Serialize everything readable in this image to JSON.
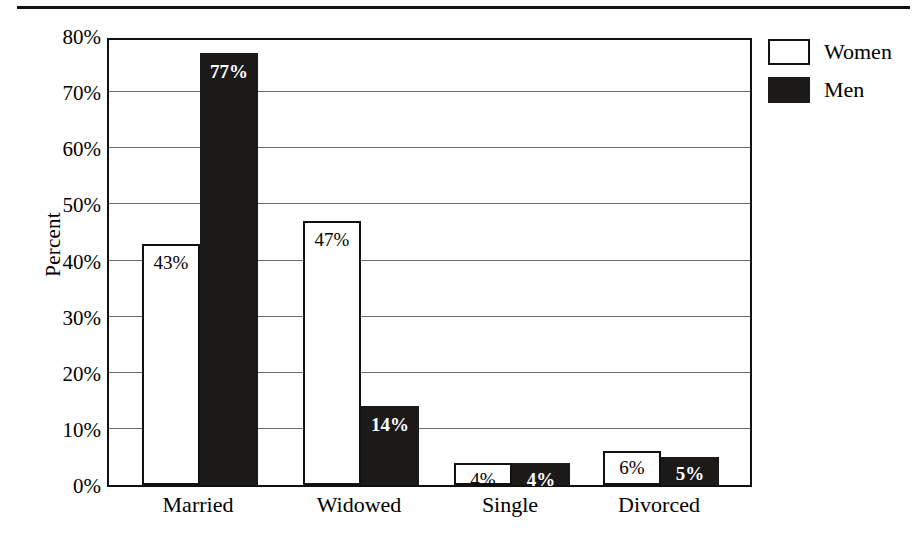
{
  "chart_data": {
    "type": "bar",
    "title": "",
    "subtitle": "",
    "xlabel": "",
    "ylabel": "Percent",
    "categories": [
      "Married",
      "Widowed",
      "Single",
      "Divorced"
    ],
    "series": [
      {
        "name": "Women",
        "values": [
          43,
          47,
          4,
          6
        ],
        "color": "#ffffff",
        "outline": "#111111"
      },
      {
        "name": "Men",
        "values": [
          77,
          14,
          4,
          5
        ],
        "color": "#1b1a18",
        "outline": "#1b1a18"
      }
    ],
    "data_labels": {
      "Women": [
        "43%",
        "47%",
        "4%",
        "6%"
      ],
      "Men": [
        "77%",
        "14%",
        "4%",
        "5%"
      ]
    },
    "ylim": [
      0,
      80
    ],
    "y_ticks": [
      0,
      10,
      20,
      30,
      40,
      50,
      60,
      70,
      80
    ],
    "y_tick_labels": [
      "0%",
      "10%",
      "20%",
      "30%",
      "40%",
      "50%",
      "60%",
      "70%",
      "80%"
    ],
    "grid": true,
    "grid_axis": "y",
    "legend_position": "top-right",
    "legend_entries": [
      "Women",
      "Men"
    ],
    "bar_mode": "grouped",
    "background": "#ffffff",
    "rule_color": "#14110f"
  },
  "axis": {
    "y_title": "Percent"
  },
  "legend": {
    "items": [
      {
        "label": "Women",
        "swatch": "white-square-swatch"
      },
      {
        "label": "Men",
        "swatch": "black-square-swatch"
      }
    ]
  }
}
